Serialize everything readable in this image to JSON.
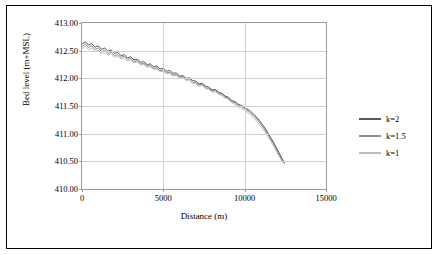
{
  "chart_data": {
    "type": "line",
    "title": "",
    "xlabel": "Distance (m)",
    "ylabel": "Bed level (m+MSL)",
    "xlim": [
      0,
      15000
    ],
    "ylim": [
      410.0,
      413.0
    ],
    "xticks": [
      0,
      5000,
      10000,
      15000
    ],
    "xtick_labels": [
      "0",
      "5000",
      "10000",
      "15000"
    ],
    "yticks": [
      410.0,
      410.5,
      411.0,
      411.5,
      412.0,
      412.5,
      413.0
    ],
    "ytick_labels": [
      "410.00",
      "410.50",
      "411.00",
      "411.50",
      "412.00",
      "412.50",
      "413.00"
    ],
    "grid": "horizontal-and-vertical-light",
    "legend_position": "right",
    "series": [
      {
        "name": "k=2",
        "color": "#595959",
        "x": [
          0,
          200,
          400,
          600,
          800,
          1000,
          1200,
          1400,
          1600,
          1800,
          2000,
          2200,
          2400,
          2600,
          2800,
          3000,
          3200,
          3400,
          3600,
          3800,
          4000,
          4200,
          4400,
          4600,
          4800,
          5000,
          5200,
          5400,
          5600,
          5800,
          6000,
          6200,
          6400,
          6600,
          6800,
          7000,
          7200,
          7400,
          7600,
          7800,
          8000,
          8200,
          8400,
          8600,
          8800,
          9000,
          9200,
          9400,
          9600,
          9800,
          10000,
          10300,
          10600,
          10900,
          11200,
          11500,
          11800,
          12100,
          12300,
          12450
        ],
        "y": [
          412.62,
          412.66,
          412.6,
          412.63,
          412.56,
          412.59,
          412.52,
          412.55,
          412.49,
          412.51,
          412.45,
          412.47,
          412.41,
          412.43,
          412.37,
          412.39,
          412.33,
          412.35,
          412.29,
          412.3,
          412.25,
          412.26,
          412.21,
          412.22,
          412.17,
          412.18,
          412.13,
          412.14,
          412.09,
          412.1,
          412.04,
          412.05,
          412.0,
          412.01,
          411.96,
          411.95,
          411.9,
          411.91,
          411.86,
          411.84,
          411.79,
          411.8,
          411.75,
          411.73,
          411.68,
          411.66,
          411.6,
          411.58,
          411.53,
          411.51,
          411.47,
          411.42,
          411.34,
          411.24,
          411.12,
          410.98,
          410.83,
          410.66,
          410.55,
          410.48
        ]
      },
      {
        "name": "k=1.5",
        "color": "#8c8c8c",
        "x": [
          0,
          200,
          400,
          600,
          800,
          1000,
          1200,
          1400,
          1600,
          1800,
          2000,
          2200,
          2400,
          2600,
          2800,
          3000,
          3200,
          3400,
          3600,
          3800,
          4000,
          4200,
          4400,
          4600,
          4800,
          5000,
          5200,
          5400,
          5600,
          5800,
          6000,
          6200,
          6400,
          6600,
          6800,
          7000,
          7200,
          7400,
          7600,
          7800,
          8000,
          8200,
          8400,
          8600,
          8800,
          9000,
          9200,
          9400,
          9600,
          9800,
          10000,
          10300,
          10600,
          10900,
          11200,
          11500,
          11800,
          12100,
          12300,
          12450
        ],
        "y": [
          412.57,
          412.62,
          412.56,
          412.59,
          412.52,
          412.55,
          412.48,
          412.51,
          412.45,
          412.47,
          412.41,
          412.43,
          412.38,
          412.4,
          412.34,
          412.36,
          412.3,
          412.32,
          412.26,
          412.27,
          412.22,
          412.23,
          412.18,
          412.19,
          412.14,
          412.15,
          412.1,
          412.11,
          412.06,
          412.07,
          412.02,
          412.03,
          411.98,
          411.99,
          411.93,
          411.92,
          411.88,
          411.89,
          411.83,
          411.82,
          411.77,
          411.78,
          411.73,
          411.71,
          411.66,
          411.64,
          411.58,
          411.56,
          411.51,
          411.49,
          411.45,
          411.39,
          411.31,
          411.21,
          411.09,
          410.95,
          410.8,
          410.63,
          410.52,
          410.46
        ]
      },
      {
        "name": "k=1",
        "color": "#bfbfbf",
        "x": [
          0,
          200,
          400,
          600,
          800,
          1000,
          1200,
          1400,
          1600,
          1800,
          2000,
          2200,
          2400,
          2600,
          2800,
          3000,
          3200,
          3400,
          3600,
          3800,
          4000,
          4200,
          4400,
          4600,
          4800,
          5000,
          5200,
          5400,
          5600,
          5800,
          6000,
          6200,
          6400,
          6600,
          6800,
          7000,
          7200,
          7400,
          7600,
          7800,
          8000,
          8200,
          8400,
          8600,
          8800,
          9000,
          9200,
          9400,
          9600,
          9800,
          10000,
          10300,
          10600,
          10900,
          11200,
          11500,
          11800,
          12100,
          12300,
          12450
        ],
        "y": [
          412.52,
          412.58,
          412.52,
          412.55,
          412.48,
          412.51,
          412.45,
          412.47,
          412.42,
          412.44,
          412.38,
          412.4,
          412.35,
          412.37,
          412.31,
          412.33,
          412.28,
          412.3,
          412.24,
          412.25,
          412.2,
          412.21,
          412.16,
          412.17,
          412.12,
          412.13,
          412.08,
          412.09,
          412.04,
          412.05,
          412.0,
          412.01,
          411.96,
          411.97,
          411.91,
          411.9,
          411.86,
          411.87,
          411.81,
          411.8,
          411.75,
          411.76,
          411.71,
          411.69,
          411.64,
          411.62,
          411.56,
          411.53,
          411.48,
          411.46,
          411.42,
          411.36,
          411.27,
          411.17,
          411.05,
          410.91,
          410.76,
          410.6,
          410.5,
          410.45
        ]
      }
    ]
  }
}
